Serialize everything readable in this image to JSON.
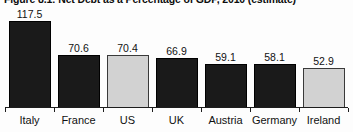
{
  "chart_data": {
    "type": "bar",
    "title": "Figure 8.1: Net Debt as a Percentage of GDP, 2010 (estimate)",
    "xlabel": "",
    "ylabel": "",
    "ylim": [
      0,
      117.5
    ],
    "grid": false,
    "legend": "none",
    "categories": [
      "Italy",
      "France",
      "US",
      "UK",
      "Austria",
      "Germany",
      "Ireland"
    ],
    "values": [
      117.5,
      70.6,
      70.4,
      66.9,
      59.1,
      58.1,
      52.9
    ],
    "value_labels": [
      "117.5",
      "70.6",
      "70.4",
      "66.9",
      "59.1",
      "58.1",
      "52.9"
    ],
    "bar_styles": [
      "dark",
      "dark",
      "light",
      "dark",
      "dark",
      "dark",
      "light"
    ],
    "colors": {
      "dark_bar_fill": "#1a1a1a",
      "dark_bar_border": "#000000",
      "light_bar_fill": "#d2d2d2",
      "light_bar_border": "#3a3a3a",
      "axis": "#1d1d1d",
      "background": "#fdfdfd",
      "text": "#111111"
    }
  }
}
